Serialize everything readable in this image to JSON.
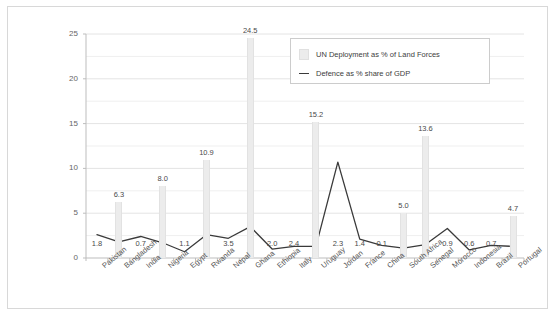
{
  "chart_data": {
    "type": "bar",
    "title": "",
    "xlabel": "",
    "ylabel": "",
    "ylim": [
      0,
      25
    ],
    "yticks": [
      0,
      5,
      10,
      15,
      20,
      25
    ],
    "ytick_labels": [
      "0",
      "5",
      "10",
      "15",
      "20",
      "25"
    ],
    "grid": true,
    "minor_gridlines": [
      2.5,
      7.5,
      12.5,
      17.5,
      22.5
    ],
    "legend_position": "top-right",
    "categories": [
      "Pakistan",
      "Bangladesh",
      "India",
      "Nigeria",
      "Egypt",
      "Rwanda",
      "Nepal",
      "Ghana",
      "Ethiopia",
      "Italy",
      "Uruguay",
      "Jordan",
      "France",
      "China",
      "South Africa",
      "Senegal",
      "Morocco",
      "Indonesia",
      "Brazil",
      "Portugal"
    ],
    "series": [
      {
        "name": "UN Deployment as % of Land Forces",
        "type": "bar",
        "color": "#ececec",
        "values": [
          null,
          6.3,
          null,
          8.0,
          null,
          10.9,
          null,
          24.5,
          null,
          null,
          15.2,
          null,
          null,
          null,
          5.0,
          13.6,
          null,
          null,
          null,
          4.7
        ],
        "labels": [
          "",
          "6.3",
          "",
          "8.0",
          "",
          "10.9",
          "",
          "24.5",
          "",
          "",
          "15.2",
          "",
          "",
          "",
          "5.0",
          "13.6",
          "",
          "",
          "",
          "4.7"
        ]
      },
      {
        "name": "Defence as % share of GDP",
        "type": "line",
        "color": "#3a3a3a",
        "values": [
          2.6,
          1.8,
          2.4,
          1.7,
          0.7,
          2.6,
          2.2,
          3.5,
          1.0,
          1.3,
          1.3,
          10.7,
          2.1,
          1.4,
          1.1,
          1.5,
          3.3,
          0.9,
          1.4,
          1.3
        ],
        "labels": [
          "1.8",
          "",
          "0.7",
          "",
          "1.1",
          "",
          "3.5",
          "",
          "2.0",
          "2.4",
          "",
          "2.3",
          "1.4",
          "0.1",
          "",
          "",
          "0.9",
          "0.6",
          "0.7",
          ""
        ],
        "label_index": [
          0,
          null,
          2,
          null,
          4,
          null,
          6,
          null,
          8,
          9,
          null,
          11,
          12,
          13,
          null,
          null,
          16,
          17,
          18,
          null
        ]
      }
    ]
  },
  "legend": {
    "items": [
      {
        "label": "UN Deployment as % of Land Forces",
        "marker": "bar-swatch"
      },
      {
        "label": "Defence as % share of GDP",
        "marker": "line-swatch"
      }
    ]
  },
  "colors": {
    "bar": "#ececec",
    "line": "#3a3a3a",
    "grid": "#e4e4e4",
    "axis": "#bdbdbd",
    "frame": "#d8d8d8",
    "text": "#4a4a4a"
  }
}
